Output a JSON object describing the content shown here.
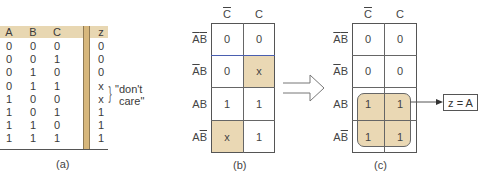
{
  "truth_table": {
    "headers": [
      "A",
      "B",
      "C",
      "z"
    ],
    "rows": [
      [
        "0",
        "0",
        "0",
        "0"
      ],
      [
        "0",
        "0",
        "1",
        "0"
      ],
      [
        "0",
        "1",
        "0",
        "0"
      ],
      [
        "0",
        "1",
        "1",
        "x"
      ],
      [
        "1",
        "0",
        "0",
        "x"
      ],
      [
        "1",
        "0",
        "1",
        "1"
      ],
      [
        "1",
        "1",
        "0",
        "1"
      ],
      [
        "1",
        "1",
        "1",
        "1"
      ]
    ],
    "annotation": "\"don't care\"",
    "annotation_line1": "\"don't",
    "annotation_line2": "care\"",
    "brace": "}",
    "caption": "(a)",
    "colors": {
      "header_bg": "#e8d7b2",
      "divider": "#d7b77c"
    }
  },
  "kmap_b": {
    "col_labels": [
      {
        "base": "C",
        "overline": true
      },
      {
        "base": "C",
        "overline": false
      }
    ],
    "row_labels": [
      {
        "a": "A",
        "a_bar": true,
        "b": "B",
        "b_bar": true
      },
      {
        "a": "A",
        "a_bar": true,
        "b": "B",
        "b_bar": false
      },
      {
        "a": "A",
        "a_bar": false,
        "b": "B",
        "b_bar": false
      },
      {
        "a": "A",
        "a_bar": false,
        "b": "B",
        "b_bar": true
      }
    ],
    "cells": [
      [
        "0",
        "0"
      ],
      [
        "0",
        "x"
      ],
      [
        "1",
        "1"
      ],
      [
        "x",
        "1"
      ]
    ],
    "highlighted": [
      [
        1,
        1
      ],
      [
        3,
        0
      ]
    ],
    "caption": "(b)",
    "colors": {
      "highlight": "#ead8b4"
    }
  },
  "arrow": {
    "direction": "right",
    "style": "hollow"
  },
  "kmap_c": {
    "col_labels": [
      {
        "base": "C",
        "overline": true
      },
      {
        "base": "C",
        "overline": false
      }
    ],
    "row_labels": [
      {
        "a": "A",
        "a_bar": true,
        "b": "B",
        "b_bar": true
      },
      {
        "a": "A",
        "a_bar": true,
        "b": "B",
        "b_bar": false
      },
      {
        "a": "A",
        "a_bar": false,
        "b": "B",
        "b_bar": false
      },
      {
        "a": "A",
        "a_bar": false,
        "b": "B",
        "b_bar": true
      }
    ],
    "cells": [
      [
        "0",
        "0"
      ],
      [
        "0",
        "0"
      ],
      [
        "1",
        "1"
      ],
      [
        "1",
        "1"
      ]
    ],
    "group": "quad rows 3-4",
    "result": "z = A",
    "caption": "(c)",
    "colors": {
      "group_fill": "#ead8b4"
    }
  }
}
